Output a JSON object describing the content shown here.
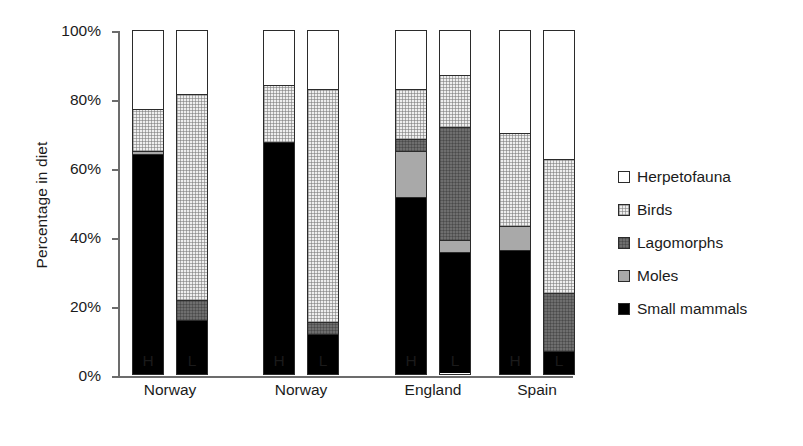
{
  "chart_data": {
    "type": "bar",
    "subtype": "stacked-bar-100-percent",
    "title": "",
    "xlabel": "",
    "ylabel": "Percentage in diet",
    "ylim": [
      0,
      100
    ],
    "ytick_labels": [
      "100%",
      "80%",
      "60%",
      "40%",
      "20%",
      "0%"
    ],
    "ytick_values": [
      100,
      80,
      60,
      40,
      20,
      0
    ],
    "grid": false,
    "legend_position": "right",
    "categories": [
      "H",
      "L",
      "H",
      "L",
      "H",
      "L",
      "H",
      "L"
    ],
    "groups": [
      {
        "name": "Norway",
        "bars": [
          "H",
          "L"
        ]
      },
      {
        "name": "Norway",
        "bars": [
          "H",
          "L"
        ]
      },
      {
        "name": "England",
        "bars": [
          "H",
          "L"
        ]
      },
      {
        "name": "Spain",
        "bars": [
          "H",
          "L"
        ]
      }
    ],
    "series": [
      {
        "name": "Small mammals",
        "color": "#000000",
        "values": [
          64,
          15.5,
          67.5,
          11.5,
          51.5,
          35.5,
          36,
          6.5
        ]
      },
      {
        "name": "Moles",
        "color": "#a9a9a9",
        "values": [
          1,
          0,
          0,
          0,
          13.5,
          3.5,
          7,
          0
        ]
      },
      {
        "name": "Lagomorphs",
        "color": "#6e6e6e",
        "values": [
          0,
          6,
          0,
          3.5,
          3.5,
          33,
          0,
          17
        ]
      },
      {
        "name": "Birds",
        "color": "#eeeeee",
        "values": [
          12,
          60,
          16.5,
          68,
          14.5,
          15,
          27,
          39
        ]
      },
      {
        "name": "Herpetofauna",
        "color": "#ffffff",
        "values": [
          23,
          18.5,
          16,
          17,
          17,
          13,
          30,
          37.5
        ]
      }
    ],
    "bars": [
      {
        "group": "Norway",
        "bar": "H",
        "segments": [
          {
            "name": "Small mammals",
            "value": 64
          },
          {
            "name": "Moles",
            "value": 1
          },
          {
            "name": "Lagomorphs",
            "value": 0
          },
          {
            "name": "Birds",
            "value": 12
          },
          {
            "name": "Herpetofauna",
            "value": 23
          }
        ]
      },
      {
        "group": "Norway",
        "bar": "L",
        "segments": [
          {
            "name": "Small mammals",
            "value": 15.5
          },
          {
            "name": "Moles",
            "value": 0
          },
          {
            "name": "Lagomorphs",
            "value": 6
          },
          {
            "name": "Birds",
            "value": 60
          },
          {
            "name": "Herpetofauna",
            "value": 18.5
          }
        ]
      },
      {
        "group": "Norway",
        "bar": "H",
        "segments": [
          {
            "name": "Small mammals",
            "value": 67.5
          },
          {
            "name": "Moles",
            "value": 0
          },
          {
            "name": "Lagomorphs",
            "value": 0
          },
          {
            "name": "Birds",
            "value": 16.5
          },
          {
            "name": "Herpetofauna",
            "value": 16
          }
        ]
      },
      {
        "group": "Norway",
        "bar": "L",
        "segments": [
          {
            "name": "Small mammals",
            "value": 11.5
          },
          {
            "name": "Moles",
            "value": 0
          },
          {
            "name": "Lagomorphs",
            "value": 3.5
          },
          {
            "name": "Birds",
            "value": 68
          },
          {
            "name": "Herpetofauna",
            "value": 17
          }
        ]
      },
      {
        "group": "England",
        "bar": "H",
        "segments": [
          {
            "name": "Small mammals",
            "value": 51.5
          },
          {
            "name": "Moles",
            "value": 13.5
          },
          {
            "name": "Lagomorphs",
            "value": 3.5
          },
          {
            "name": "Birds",
            "value": 14.5
          },
          {
            "name": "Herpetofauna",
            "value": 17
          }
        ]
      },
      {
        "group": "England",
        "bar": "L",
        "segments": [
          {
            "name": "Small mammals",
            "value": 35.5
          },
          {
            "name": "Moles",
            "value": 3.5
          },
          {
            "name": "Lagomorphs",
            "value": 33
          },
          {
            "name": "Birds",
            "value": 15
          },
          {
            "name": "Herpetofauna",
            "value": 13
          }
        ]
      },
      {
        "group": "Spain",
        "bar": "H",
        "segments": [
          {
            "name": "Small mammals",
            "value": 36
          },
          {
            "name": "Moles",
            "value": 7
          },
          {
            "name": "Lagomorphs",
            "value": 0
          },
          {
            "name": "Birds",
            "value": 27
          },
          {
            "name": "Herpetofauna",
            "value": 30
          }
        ]
      },
      {
        "group": "Spain",
        "bar": "L",
        "segments": [
          {
            "name": "Small mammals",
            "value": 6.5
          },
          {
            "name": "Moles",
            "value": 0
          },
          {
            "name": "Lagomorphs",
            "value": 17
          },
          {
            "name": "Birds",
            "value": 39
          },
          {
            "name": "Herpetofauna",
            "value": 37.5
          }
        ]
      }
    ],
    "legend": [
      {
        "label": "Herpetofauna",
        "key": "herpetofauna",
        "color": "#ffffff"
      },
      {
        "label": "Birds",
        "key": "birds",
        "color": "#eeeeee"
      },
      {
        "label": "Lagomorphs",
        "key": "lagomorphs",
        "color": "#6e6e6e"
      },
      {
        "label": "Moles",
        "key": "moles",
        "color": "#a9a9a9"
      },
      {
        "label": "Small mammals",
        "key": "smallmammals",
        "color": "#000000"
      }
    ]
  }
}
